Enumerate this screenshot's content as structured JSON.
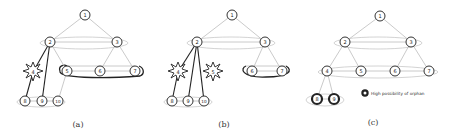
{
  "figure": {
    "panels": [
      {
        "id": "a",
        "caption": "(a)",
        "nodes": [
          {
            "label": "1",
            "x": 85,
            "y": 15,
            "type": "normal"
          },
          {
            "label": "2",
            "x": 50,
            "y": 42,
            "type": "normal"
          },
          {
            "label": "3",
            "x": 117,
            "y": 42,
            "type": "normal"
          },
          {
            "label": "4",
            "x": 33,
            "y": 72,
            "type": "failed"
          },
          {
            "label": "5",
            "x": 67,
            "y": 71,
            "type": "normal"
          },
          {
            "label": "6",
            "x": 100,
            "y": 71,
            "type": "normal"
          },
          {
            "label": "7",
            "x": 135,
            "y": 71,
            "type": "normal"
          },
          {
            "label": "8",
            "x": 25,
            "y": 101,
            "type": "normal"
          },
          {
            "label": "9",
            "x": 42,
            "y": 101,
            "type": "normal"
          },
          {
            "label": "10",
            "x": 58,
            "y": 101,
            "type": "normal"
          }
        ]
      },
      {
        "id": "b",
        "caption": "(b)",
        "nodes": [
          {
            "label": "1",
            "x": 232,
            "y": 15,
            "type": "normal"
          },
          {
            "label": "2",
            "x": 197,
            "y": 42,
            "type": "normal"
          },
          {
            "label": "3",
            "x": 265,
            "y": 42,
            "type": "normal"
          },
          {
            "label": "4",
            "x": 178,
            "y": 72,
            "type": "failed"
          },
          {
            "label": "5",
            "x": 213,
            "y": 72,
            "type": "failed"
          },
          {
            "label": "6",
            "x": 252,
            "y": 71,
            "type": "normal"
          },
          {
            "label": "7",
            "x": 282,
            "y": 71,
            "type": "normal"
          },
          {
            "label": "8",
            "x": 172,
            "y": 101,
            "type": "normal"
          },
          {
            "label": "9",
            "x": 188,
            "y": 101,
            "type": "normal"
          },
          {
            "label": "10",
            "x": 204,
            "y": 101,
            "type": "normal"
          }
        ]
      },
      {
        "id": "c",
        "caption": "(c)",
        "nodes": [
          {
            "label": "1",
            "x": 380,
            "y": 16,
            "type": "normal"
          },
          {
            "label": "2",
            "x": 345,
            "y": 42,
            "type": "normal"
          },
          {
            "label": "3",
            "x": 411,
            "y": 42,
            "type": "normal"
          },
          {
            "label": "4",
            "x": 327,
            "y": 71,
            "type": "normal"
          },
          {
            "label": "5",
            "x": 361,
            "y": 71,
            "type": "normal"
          },
          {
            "label": "6",
            "x": 395,
            "y": 71,
            "type": "normal"
          },
          {
            "label": "7",
            "x": 429,
            "y": 71,
            "type": "normal"
          },
          {
            "label": "8",
            "x": 317,
            "y": 99,
            "type": "orphan"
          },
          {
            "label": "9",
            "x": 334,
            "y": 99,
            "type": "orphan"
          }
        ]
      }
    ],
    "legend": {
      "label": "High possibility of orphan",
      "marker": "bold-circle"
    }
  }
}
